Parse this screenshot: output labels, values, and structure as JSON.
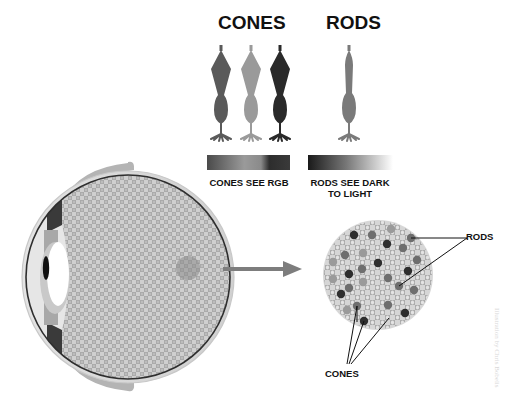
{
  "headings": {
    "cones": "CONES",
    "rods": "RODS"
  },
  "legend": {
    "cones_caption": "CONES SEE RGB",
    "rods_caption_line1": "RODS SEE DARK",
    "rods_caption_line2": "TO LIGHT"
  },
  "callouts": {
    "rods": "RODS",
    "cones": "CONES"
  },
  "watermark": "Illustration by Chris Bobelis",
  "colors": {
    "cone_1": "#5a5a5a",
    "cone_2": "#9a9a9a",
    "cone_3": "#2a2a2a",
    "rod": "#7a7a7a",
    "arrow": "#7d7d7d",
    "sclera": "#d9d9d9",
    "eyelid": "#b4b4b4",
    "retina_dark": "#a7a7a7",
    "retina_light": "#cfcfcf"
  },
  "diagram": {
    "cells": [
      {
        "type": "cone",
        "tone": "cone_1"
      },
      {
        "type": "cone",
        "tone": "cone_2"
      },
      {
        "type": "cone",
        "tone": "cone_3"
      },
      {
        "type": "rod",
        "tone": "rod"
      }
    ],
    "zoom_dots": [
      {
        "x": 354,
        "y": 235,
        "tone": "dark"
      },
      {
        "x": 372,
        "y": 235,
        "tone": "mid"
      },
      {
        "x": 391,
        "y": 229,
        "tone": "light"
      },
      {
        "x": 411,
        "y": 238,
        "tone": "mid"
      },
      {
        "x": 387,
        "y": 244,
        "tone": "dark"
      },
      {
        "x": 403,
        "y": 248,
        "tone": "mid"
      },
      {
        "x": 345,
        "y": 255,
        "tone": "mid"
      },
      {
        "x": 363,
        "y": 253,
        "tone": "light"
      },
      {
        "x": 417,
        "y": 260,
        "tone": "mid"
      },
      {
        "x": 378,
        "y": 263,
        "tone": "dark"
      },
      {
        "x": 333,
        "y": 262,
        "tone": "light"
      },
      {
        "x": 362,
        "y": 269,
        "tone": "mid"
      },
      {
        "x": 408,
        "y": 271,
        "tone": "dark"
      },
      {
        "x": 349,
        "y": 274,
        "tone": "dark"
      },
      {
        "x": 388,
        "y": 278,
        "tone": "mid"
      },
      {
        "x": 333,
        "y": 279,
        "tone": "light"
      },
      {
        "x": 363,
        "y": 282,
        "tone": "light"
      },
      {
        "x": 399,
        "y": 286,
        "tone": "mid"
      },
      {
        "x": 349,
        "y": 288,
        "tone": "mid"
      },
      {
        "x": 414,
        "y": 290,
        "tone": "mid"
      },
      {
        "x": 341,
        "y": 294,
        "tone": "dark"
      },
      {
        "x": 357,
        "y": 306,
        "tone": "mid"
      },
      {
        "x": 388,
        "y": 305,
        "tone": "mid"
      },
      {
        "x": 347,
        "y": 310,
        "tone": "light"
      },
      {
        "x": 405,
        "y": 313,
        "tone": "dark"
      },
      {
        "x": 364,
        "y": 321,
        "tone": "dark"
      }
    ]
  }
}
